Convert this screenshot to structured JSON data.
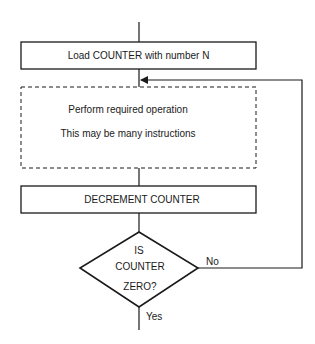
{
  "diagram": {
    "type": "flowchart",
    "nodes": {
      "load": {
        "shape": "process",
        "text": "Load COUNTER with number N"
      },
      "operation": {
        "shape": "dashed-process",
        "line1": "Perform required operation",
        "line2": "This may be many instructions"
      },
      "decrement": {
        "shape": "process",
        "text": "DECREMENT COUNTER"
      },
      "decision": {
        "shape": "decision",
        "line1": "IS",
        "line2": "COUNTER",
        "line3": "ZERO?"
      }
    },
    "edges": {
      "no_label": "No",
      "yes_label": "Yes"
    },
    "colors": {
      "stroke": "#1a1a1a",
      "background": "#ffffff"
    }
  }
}
